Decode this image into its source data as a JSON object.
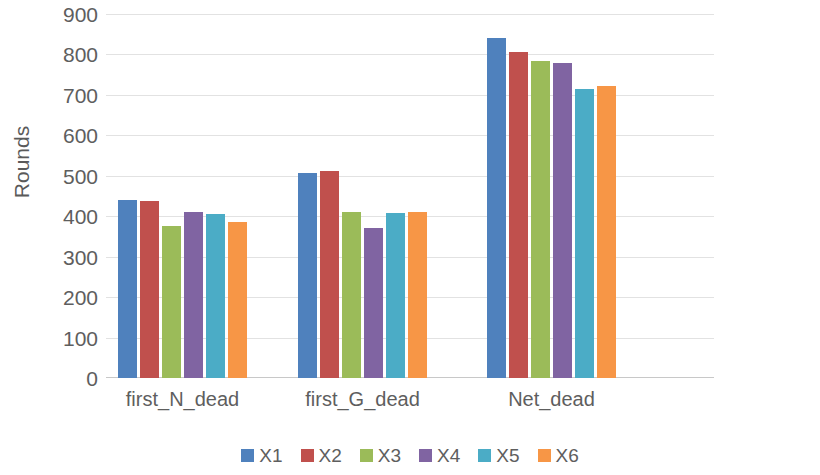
{
  "chart_data": {
    "type": "bar",
    "title": "",
    "xlabel": "",
    "ylabel": "Rounds",
    "ylim": [
      0,
      900
    ],
    "ytick_step": 100,
    "yticks": [
      900,
      800,
      700,
      600,
      500,
      400,
      300,
      200,
      100,
      0
    ],
    "grid": true,
    "legend_position": "bottom",
    "categories": [
      "first_N_dead",
      "first_G_dead",
      "Net_dead"
    ],
    "series": [
      {
        "name": "X1",
        "color": "#4F81BD",
        "values": [
          440,
          508,
          840
        ]
      },
      {
        "name": "X2",
        "color": "#C0504D",
        "values": [
          438,
          512,
          806
        ]
      },
      {
        "name": "X3",
        "color": "#9BBB59",
        "values": [
          376,
          410,
          784
        ]
      },
      {
        "name": "X4",
        "color": "#8064A2",
        "values": [
          410,
          370,
          780
        ]
      },
      {
        "name": "X5",
        "color": "#4BACC6",
        "values": [
          406,
          408,
          714
        ]
      },
      {
        "name": "X6",
        "color": "#F79646",
        "values": [
          385,
          411,
          722
        ]
      }
    ]
  },
  "axis": {
    "y_title": "Rounds"
  },
  "colors": {
    "background": "#FFFFFF",
    "gridline": "#E2E2E2",
    "axis_line": "#C8C8C8",
    "text": "#5E5E5E"
  }
}
